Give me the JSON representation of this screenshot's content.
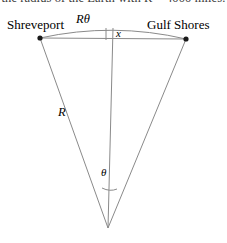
{
  "page": {
    "width": 227,
    "height": 243,
    "background": "#ffffff",
    "cropped_heading_text": "the radius of the Earth with R = 4000 miles."
  },
  "diagram": {
    "type": "circular-sector-sagitta",
    "stroke_color": "#8a8a8a",
    "point_color": "#1a1a1a",
    "labels": {
      "left_city": "Shreveport",
      "right_city": "Gulf Shores",
      "arc_length": "Rθ",
      "sagitta": "x",
      "radius": "R",
      "angle": "θ"
    },
    "geometry": {
      "apex": [
        108,
        228
      ],
      "left_point": [
        40,
        38
      ],
      "right_point": [
        186,
        39
      ],
      "arc_top": [
        113,
        30
      ],
      "center_line_x": 113,
      "chord_y_left": 38,
      "chord_y_right": 39
    }
  }
}
